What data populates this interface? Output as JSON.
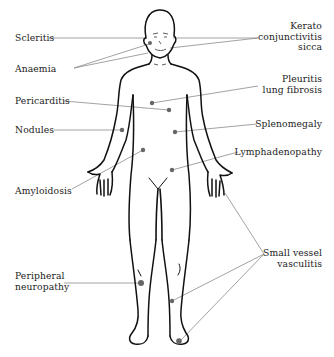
{
  "diagram": {
    "type": "anatomical-body-map",
    "colors": {
      "outline": "#111111",
      "leader_line": "#8a8a8a",
      "marker_dot": "#666666",
      "text": "#222222",
      "background": "#ffffff"
    },
    "labels_left": [
      {
        "id": "scleritis",
        "lines": [
          "Scleritis"
        ]
      },
      {
        "id": "anaemia",
        "lines": [
          "Anaemia"
        ]
      },
      {
        "id": "pericarditis",
        "lines": [
          "Pericarditis"
        ]
      },
      {
        "id": "nodules",
        "lines": [
          "Nodules"
        ]
      },
      {
        "id": "amyloidosis",
        "lines": [
          "Amyloidosis"
        ]
      },
      {
        "id": "peripheral-neuropathy",
        "lines": [
          "Peripheral",
          "neuropathy"
        ]
      }
    ],
    "labels_right": [
      {
        "id": "kerato-conjunctivitis-sicca",
        "lines": [
          "Kerato",
          "conjunctivitis",
          "sicca"
        ]
      },
      {
        "id": "pleuritis-lung-fibrosis",
        "lines": [
          "Pleuritis",
          "lung fibrosis"
        ]
      },
      {
        "id": "splenomegaly",
        "lines": [
          "Splenomegaly"
        ]
      },
      {
        "id": "lymphadenopathy",
        "lines": [
          "Lymphadenopathy"
        ]
      },
      {
        "id": "small-vessel-vasculitis",
        "lines": [
          "Small vessel",
          "vasculitis"
        ]
      }
    ]
  }
}
